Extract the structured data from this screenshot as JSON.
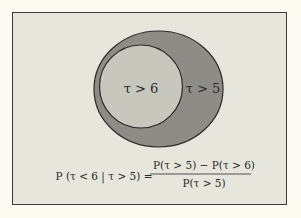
{
  "diagram": {
    "type": "venn",
    "outer_set": {
      "label": "τ > 5",
      "fill": "#8e8c86"
    },
    "inner_set": {
      "label": "τ > 6",
      "fill": "#c8c7be"
    },
    "background": "#e7e6dc",
    "page_background": "#fbfbf1",
    "stroke": "#2a2a28"
  },
  "formula": {
    "lhs": "P (τ < 6 | τ > 5) =",
    "numerator": "P(τ > 5) − P(τ > 6)",
    "denominator": "P(τ > 5)"
  }
}
